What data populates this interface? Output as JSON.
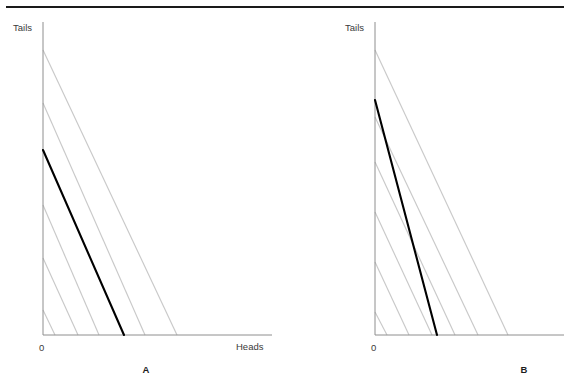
{
  "figure": {
    "title": "",
    "top_rule": {
      "name": "top-divider-rule",
      "x1": 6,
      "x2": 564,
      "y": 7,
      "color": "#1a1a1a",
      "width": 2.2
    },
    "background_color": "#ffffff",
    "axis_color": "#8e8e8e",
    "budget_line_color": "#000000",
    "indifference_line_color": "#c9c9c9"
  },
  "panels": [
    {
      "id": "A",
      "label": "A",
      "label_x": 146,
      "label_y": 373,
      "y_axis_label": "Tails",
      "y_axis_label_x": 13,
      "y_axis_label_y": 31,
      "x_axis_label": "Heads",
      "x_axis_label_x": 236,
      "x_axis_label_y": 350,
      "origin_label": "0",
      "origin_label_x": 39,
      "origin_label_y": 351,
      "axes": {
        "x_origin": 43,
        "y_origin": 335,
        "y_top": 22,
        "x_right": 272
      },
      "chart": {
        "budget_line": {
          "name": "budget-line-A",
          "x1": 43,
          "y1": 150,
          "x2": 124,
          "y2": 335
        },
        "indifference_lines": [
          {
            "x1": 43,
            "y1": 310,
            "x2": 55,
            "y2": 335
          },
          {
            "x1": 43,
            "y1": 258,
            "x2": 78,
            "y2": 335
          },
          {
            "x1": 43,
            "y1": 205,
            "x2": 99,
            "y2": 335
          },
          {
            "x1": 43,
            "y1": 103,
            "x2": 145,
            "y2": 335
          },
          {
            "x1": 43,
            "y1": 50,
            "x2": 177,
            "y2": 335
          }
        ]
      }
    },
    {
      "id": "B",
      "label": "B",
      "label_x": 524,
      "label_y": 373,
      "y_axis_label": "Tails",
      "y_axis_label_x": 345,
      "y_axis_label_y": 31,
      "x_axis_label": "",
      "x_axis_label_x": 0,
      "x_axis_label_y": 0,
      "origin_label": "0",
      "origin_label_x": 371,
      "origin_label_y": 351,
      "axes": {
        "x_origin": 375,
        "y_origin": 335,
        "y_top": 22,
        "x_right": 564
      },
      "chart": {
        "budget_line": {
          "name": "budget-line-B",
          "x1": 375,
          "y1": 100,
          "x2": 437,
          "y2": 335
        },
        "indifference_lines": [
          {
            "x1": 375,
            "y1": 312,
            "x2": 387,
            "y2": 335
          },
          {
            "x1": 375,
            "y1": 262,
            "x2": 409,
            "y2": 335
          },
          {
            "x1": 375,
            "y1": 212,
            "x2": 432,
            "y2": 335
          },
          {
            "x1": 375,
            "y1": 162,
            "x2": 455,
            "y2": 335
          },
          {
            "x1": 375,
            "y1": 117,
            "x2": 478,
            "y2": 335
          },
          {
            "x1": 375,
            "y1": 50,
            "x2": 508,
            "y2": 335
          }
        ]
      }
    }
  ],
  "chart_data": {
    "type": "line",
    "title": "",
    "subtitle": "",
    "xlabel": "Heads",
    "ylabel": "Tails",
    "grid": false,
    "legend": null,
    "annotations": [
      "A",
      "B",
      "0"
    ],
    "panels": [
      {
        "name": "A",
        "xlabel": "Heads",
        "ylabel": "Tails",
        "origin": "0",
        "series": [
          {
            "name": "budget-line",
            "style": "solid-black",
            "x": [
              0,
              81
            ],
            "y": [
              185,
              0
            ],
            "slope": -2.28
          },
          {
            "name": "indifference-lines",
            "style": "solid-lightgray",
            "slope": -2.79,
            "y_intercepts": [
              25,
              77,
              130,
              232,
              285
            ],
            "x_intercepts": [
              12,
              35,
              56,
              102,
              134
            ]
          }
        ]
      },
      {
        "name": "B",
        "xlabel": "",
        "ylabel": "Tails",
        "origin": "0",
        "series": [
          {
            "name": "budget-line",
            "style": "solid-black",
            "x": [
              0,
              62
            ],
            "y": [
              235,
              0
            ],
            "slope": -3.79
          },
          {
            "name": "indifference-lines",
            "style": "solid-lightgray",
            "slope": -2.1,
            "y_intercepts": [
              23,
              73,
              123,
              173,
              218,
              285
            ],
            "x_intercepts": [
              12,
              34,
              57,
              80,
              103,
              133
            ]
          }
        ]
      }
    ]
  }
}
